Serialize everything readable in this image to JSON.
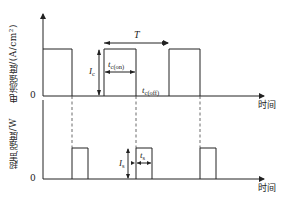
{
  "top_plot": {
    "y_label": "电流强度/(A/cm²)",
    "x_label": "时间",
    "zero_label": "0",
    "period_label": "T",
    "amplitude_label": "I",
    "amplitude_sub": "c",
    "on_time_label": "t",
    "on_time_sub": "c(on)",
    "off_time_label": "t",
    "off_time_sub": "c(off)"
  },
  "bottom_plot": {
    "y_label": "超声强度/W",
    "x_label": "时间",
    "zero_label": "0",
    "amplitude_label": "I",
    "amplitude_sub": "s",
    "on_time_label": "t",
    "on_time_sub": "s"
  },
  "colors": {
    "line": "#222222",
    "dashed": "#444444"
  }
}
